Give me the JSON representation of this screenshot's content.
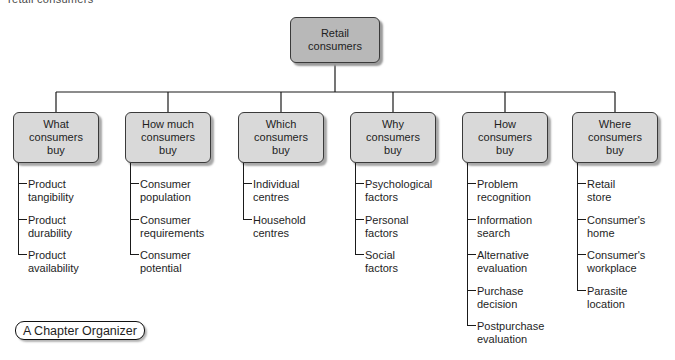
{
  "caption": "retail consumers",
  "root": {
    "label": "Retail\nconsumers"
  },
  "columns": [
    {
      "title": "What\nconsumers\nbuy",
      "items": [
        "Product\ntangibility",
        "Product\ndurability",
        "Product\navailability"
      ]
    },
    {
      "title": "How much\nconsumers\nbuy",
      "items": [
        "Consumer\npopulation",
        "Consumer\nrequirements",
        "Consumer\npotential"
      ]
    },
    {
      "title": "Which\nconsumers\nbuy",
      "items": [
        "Individual\ncentres",
        "Household\ncentres"
      ]
    },
    {
      "title": "Why\nconsumers\nbuy",
      "items": [
        "Psychological\nfactors",
        "Personal\nfactors",
        "Social\nfactors"
      ]
    },
    {
      "title": "How\nconsumers\nbuy",
      "items": [
        "Problem\nrecognition",
        "Information\nsearch",
        "Alternative\nevaluation",
        "Purchase\ndecision",
        "Postpurchase\nevaluation"
      ]
    },
    {
      "title": "Where\nconsumers\nbuy",
      "items": [
        "Retail\nstore",
        "Consumer's\nhome",
        "Consumer's\nworkplace",
        "Parasite\nlocation"
      ]
    }
  ],
  "badge": {
    "label": "A Chapter Organizer"
  },
  "colors": {
    "root_fill": "#b8b8b8",
    "node_fill": "#d9d9d9",
    "node_border": "#3a3a3a",
    "connector_line": "#1a1a1a",
    "shadow": "#a8a8a8"
  }
}
